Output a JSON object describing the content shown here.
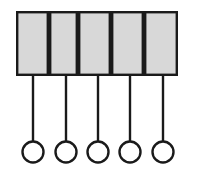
{
  "diagram": {
    "canvas": {
      "width": 198,
      "height": 176,
      "background": "#ffffff"
    },
    "style": {
      "cell_fill": "#d8d8d8",
      "cell_stroke": "#1a1a1a",
      "cell_stroke_width": 2.4,
      "stem_stroke": "#1a1a1a",
      "stem_stroke_width": 2.4,
      "circle_stroke": "#1a1a1a",
      "circle_stroke_width": 2.4,
      "circle_fill": "#ffffff"
    },
    "bar": {
      "x": 16,
      "y": 11,
      "width": 162,
      "height": 65,
      "cell_count": 5,
      "cell_edges": [
        16,
        49,
        78,
        111,
        144,
        178
      ]
    },
    "cells": [
      {
        "index": 1,
        "x": 16,
        "width": 33,
        "fill": "#d8d8d8"
      },
      {
        "index": 2,
        "x": 49,
        "width": 29,
        "fill": "#d8d8d8"
      },
      {
        "index": 3,
        "x": 78,
        "width": 33,
        "fill": "#d8d8d8"
      },
      {
        "index": 4,
        "x": 111,
        "width": 33,
        "fill": "#d8d8d8"
      },
      {
        "index": 5,
        "x": 144,
        "width": 34,
        "fill": "#d8d8d8"
      }
    ],
    "stems": [
      {
        "index": 1,
        "x": 33,
        "y_top": 76,
        "y_bottom": 142
      },
      {
        "index": 2,
        "x": 66,
        "y_top": 76,
        "y_bottom": 142
      },
      {
        "index": 3,
        "x": 98,
        "y_top": 76,
        "y_bottom": 142
      },
      {
        "index": 4,
        "x": 130,
        "y_top": 76,
        "y_bottom": 142
      },
      {
        "index": 5,
        "x": 163,
        "y_top": 76,
        "y_bottom": 142
      }
    ],
    "nodes": [
      {
        "index": 1,
        "cx": 33,
        "cy": 152,
        "r": 10.5
      },
      {
        "index": 2,
        "cx": 66,
        "cy": 152,
        "r": 10.5
      },
      {
        "index": 3,
        "cx": 98,
        "cy": 152,
        "r": 10.5
      },
      {
        "index": 4,
        "cx": 130,
        "cy": 152,
        "r": 10.5
      },
      {
        "index": 5,
        "cx": 163,
        "cy": 152,
        "r": 10.5
      }
    ],
    "labels": []
  }
}
